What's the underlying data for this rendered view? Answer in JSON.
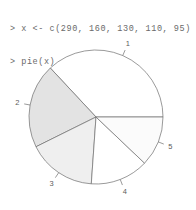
{
  "console": {
    "prompt": ">",
    "lines": [
      "> x <- c(290, 160, 130, 110, 95)",
      "> pie(x)"
    ],
    "line1": "> x <- c(290, 160, 130, 110, 95)",
    "line2": "> pie(x)"
  },
  "chart_data": {
    "type": "pie",
    "title": "",
    "xlabel": "",
    "ylabel": "",
    "categories": [
      "1",
      "2",
      "3",
      "4",
      "5"
    ],
    "values": [
      290,
      160,
      130,
      110,
      95
    ],
    "total": 785,
    "labels": [
      "1",
      "2",
      "3",
      "4",
      "5"
    ],
    "percentages": [
      36.9,
      20.4,
      16.6,
      14.0,
      12.1
    ],
    "angles_deg": [
      133.0,
      73.4,
      59.6,
      50.4,
      43.6
    ],
    "start_angle_deg": 0,
    "direction": "counterclockwise",
    "legend": "none",
    "grid": false,
    "slice_colors": [
      "#ffffff",
      "#e3e3e3",
      "#efefef",
      "#ffffff",
      "#fbfbfb"
    ],
    "border_color": "#6f6f6f",
    "label_color": "#5d5d5d",
    "background": "#ffffff",
    "center_x": 96,
    "center_y": 89,
    "radius": 67
  },
  "labels": {
    "l1": "1",
    "l2": "2",
    "l3": "3",
    "l4": "4",
    "l5": "5"
  }
}
